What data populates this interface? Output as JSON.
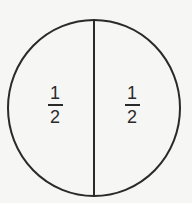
{
  "diagram": {
    "shape": "circle",
    "divisions": 2,
    "stroke_color": "#2a2a2a",
    "background_color": "#f6f6f4",
    "parts": [
      {
        "label_numerator": "1",
        "label_denominator": "2"
      },
      {
        "label_numerator": "1",
        "label_denominator": "2"
      }
    ]
  }
}
